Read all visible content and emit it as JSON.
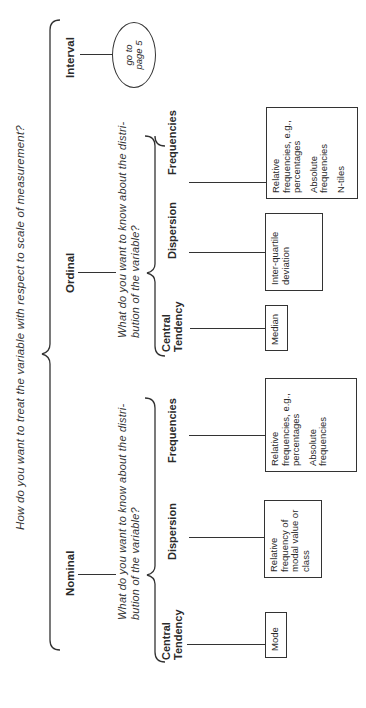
{
  "main_question": "How do you want to treat the variable with respect to scale of measurement?",
  "levels": [
    {
      "label": "Nominal",
      "sub_question_line1": "What do you want to know about the distri-",
      "sub_question_line2": "bution of the variable?",
      "categories": [
        {
          "label_line1": "Central",
          "label_line2": "Tendency",
          "box": [
            "Mode"
          ]
        },
        {
          "label_line1": "Dispersion",
          "label_line2": "",
          "box": [
            "Relative frequency of modal value or class"
          ]
        },
        {
          "label_line1": "Frequencies",
          "label_line2": "",
          "box": [
            "Relative frequencies, e.g., percentages",
            "Absolute frequencies"
          ]
        }
      ]
    },
    {
      "label": "Ordinal",
      "sub_question_line1": "What do you want to know about the distri-",
      "sub_question_line2": "bution of the variable?",
      "categories": [
        {
          "label_line1": "Central",
          "label_line2": "Tendency",
          "box": [
            "Median"
          ]
        },
        {
          "label_line1": "Dispersion",
          "label_line2": "",
          "box": [
            "Inter-quartile deviation"
          ]
        },
        {
          "label_line1": "Frequencies",
          "label_line2": "",
          "box": [
            "Relative frequencies, e.g., percentages",
            "Absolute frequencies",
            "N-tiles"
          ]
        }
      ]
    },
    {
      "label": "Interval",
      "goto_line1": "go to",
      "goto_line2": "page 5"
    }
  ]
}
